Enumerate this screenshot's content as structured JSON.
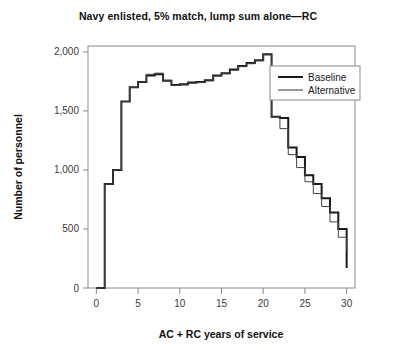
{
  "chart_data": {
    "type": "line",
    "title": "Navy enlisted, 5% match, lump sum alone—RC",
    "xlabel": "AC + RC years of service",
    "ylabel": "Number of personnel",
    "xlim": [
      -1,
      31
    ],
    "ylim": [
      0,
      2050
    ],
    "xticks": [
      0,
      5,
      10,
      15,
      20,
      25,
      30
    ],
    "xtick_labels": [
      "0",
      "5",
      "10",
      "15",
      "20",
      "25",
      "30"
    ],
    "yticks": [
      0,
      500,
      1000,
      1500,
      2000
    ],
    "ytick_labels": [
      "0",
      "500",
      "1,000",
      "1,500",
      "2,000"
    ],
    "grid": false,
    "drawstyle": "steps-post",
    "legend_position": "upper right",
    "x": [
      0,
      1,
      2,
      3,
      4,
      5,
      6,
      7,
      8,
      9,
      10,
      11,
      12,
      13,
      14,
      15,
      16,
      17,
      18,
      19,
      20,
      21,
      22,
      23,
      24,
      25,
      26,
      27,
      28,
      29,
      30
    ],
    "series": [
      {
        "name": "Baseline",
        "line_width": 2.0,
        "color": "#1a1a1a",
        "values": [
          0,
          880,
          1000,
          1580,
          1700,
          1745,
          1800,
          1810,
          1755,
          1720,
          1725,
          1740,
          1745,
          1760,
          1800,
          1820,
          1850,
          1880,
          1905,
          1930,
          1980,
          1450,
          1440,
          1190,
          1110,
          955,
          880,
          760,
          640,
          500,
          170
        ]
      },
      {
        "name": "Alternative",
        "line_width": 1.0,
        "color": "#444444",
        "values": [
          0,
          880,
          1000,
          1580,
          1700,
          1745,
          1810,
          1820,
          1760,
          1715,
          1720,
          1735,
          1740,
          1755,
          1795,
          1815,
          1845,
          1875,
          1900,
          1925,
          1975,
          1450,
          1350,
          1130,
          1020,
          900,
          800,
          690,
          560,
          430,
          320
        ]
      }
    ]
  }
}
